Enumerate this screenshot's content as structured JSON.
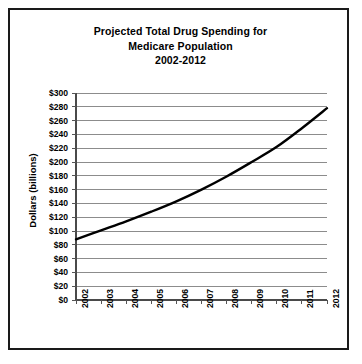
{
  "chart_data": {
    "type": "line",
    "title": "Projected Total Drug Spending for Medicare Population 2002-2012",
    "title_lines": [
      "Projected Total Drug Spending for",
      "Medicare Population",
      "2002-2012"
    ],
    "xlabel": "",
    "ylabel": "Dollars (billions)",
    "categories": [
      "2002",
      "2003",
      "2004",
      "2005",
      "2006",
      "2007",
      "2008",
      "2009",
      "2010",
      "2011",
      "2012"
    ],
    "x": [
      2002,
      2003,
      2004,
      2005,
      2006,
      2007,
      2008,
      2009,
      2010,
      2011,
      2012
    ],
    "values": [
      88,
      101,
      114,
      128,
      143,
      160,
      179,
      200,
      222,
      249,
      278
    ],
    "series": [
      {
        "name": "Projected Total Drug Spending",
        "values": [
          88,
          101,
          114,
          128,
          143,
          160,
          179,
          200,
          222,
          249,
          278
        ]
      }
    ],
    "ylim": [
      0,
      300
    ],
    "ytick_values": [
      0,
      20,
      40,
      60,
      80,
      100,
      120,
      140,
      160,
      180,
      200,
      220,
      240,
      260,
      280,
      300
    ],
    "ytick_labels": [
      "$0",
      "$20",
      "$40",
      "$60",
      "$80",
      "$100",
      "$120",
      "$140",
      "$160",
      "$180",
      "$200",
      "$220",
      "$240",
      "$260",
      "$280",
      "$300"
    ],
    "grid": true,
    "grid_axis": "y",
    "legend": false,
    "legend_position": "none",
    "line_color": "#000000",
    "line_width": 2.4,
    "grid_color": "#8c8c8c",
    "axis_color": "#555555",
    "background_color": "#ffffff",
    "border_color": "#1a1a1a"
  }
}
